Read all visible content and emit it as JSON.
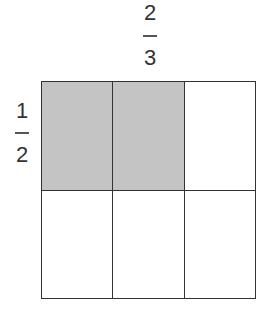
{
  "top_fraction": {
    "numerator": "2",
    "denominator": "3"
  },
  "left_fraction": {
    "numerator": "1",
    "denominator": "2"
  },
  "grid": {
    "rows": 2,
    "columns": 3,
    "shaded_cells": [
      [
        0,
        0
      ],
      [
        0,
        1
      ]
    ],
    "shade_color": "#c4c4c4",
    "line_color": "#333333"
  }
}
